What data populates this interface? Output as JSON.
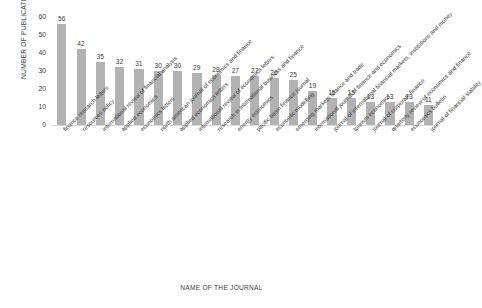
{
  "chart_data": {
    "type": "bar",
    "title": "",
    "xlabel": "NAME OF THE JOURNAL",
    "ylabel": "NUMBER OF PUBLICATIONS",
    "ylim": [
      0,
      60
    ],
    "yticks": [
      0,
      10,
      20,
      30,
      40,
      50,
      60
    ],
    "grid": false,
    "legend": "none",
    "bar_color": "#b2b2b2",
    "data_labels": true,
    "categories": [
      "finance research letters",
      "resources policy",
      "international review of financial analysis",
      "applied economics",
      "economics letters",
      "north american journal of economics and finance",
      "applied economics letters",
      "international review of economics letters",
      "research in international business and finance",
      "energy economics",
      "pacific basin finance journal",
      "economic modelling",
      "emerging markets finance and trade",
      "international journal of finance and economics",
      "journal of international financial markets, institutions and money",
      "tourism economics",
      "journal of corporate finance",
      "quarterly review of economics and finance",
      "economics bulletin",
      "journal of financial stability"
    ],
    "values": [
      56,
      42,
      35,
      32,
      31,
      30,
      30,
      29,
      28,
      27,
      27,
      26,
      25,
      19,
      15,
      15,
      13,
      13,
      13,
      11
    ]
  }
}
